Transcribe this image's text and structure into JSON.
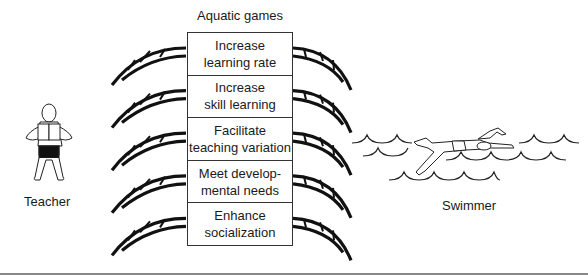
{
  "title": "Aquatic games",
  "benefits": [
    {
      "line1": "Increase",
      "line2": "learning rate"
    },
    {
      "line1": "Increase",
      "line2": "skill learning"
    },
    {
      "line1": "Facilitate",
      "line2": "teaching variation"
    },
    {
      "line1": "Meet develop-",
      "line2": "mental needs"
    },
    {
      "line1": "Enhance",
      "line2": "socialization"
    }
  ],
  "labels": {
    "teacher": "Teacher",
    "swimmer": "Swimmer"
  },
  "icons": {
    "teacher": "teacher-figure-icon",
    "swimmer": "swimmer-figure-icon",
    "bridge": "bridge-arc-icon",
    "waves": "waves-icon"
  }
}
